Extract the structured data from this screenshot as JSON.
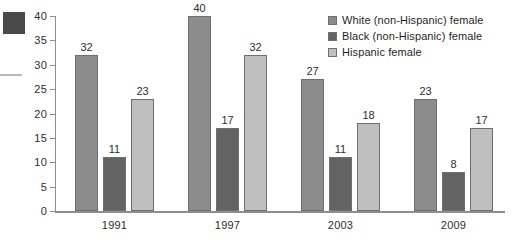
{
  "chart_data": {
    "type": "bar",
    "title": "",
    "xlabel": "",
    "ylabel": "",
    "categories": [
      "1991",
      "1997",
      "2003",
      "2009"
    ],
    "series": [
      {
        "name": "White (non-Hispanic) female",
        "color": "#8c8c8c",
        "values": [
          32,
          40,
          27,
          23
        ]
      },
      {
        "name": "Black (non-Hispanic) female",
        "color": "#636363",
        "values": [
          11,
          17,
          11,
          8
        ]
      },
      {
        "name": "Hispanic female",
        "color": "#bfbfbf",
        "values": [
          23,
          32,
          18,
          17
        ]
      }
    ],
    "ylim": [
      0,
      40
    ],
    "yticks": [
      0,
      5,
      10,
      15,
      20,
      25,
      30,
      35,
      40
    ],
    "grid": false,
    "legend_position": "top-right",
    "data_labels": true
  },
  "legend": {
    "items": [
      {
        "label": "White (non-Hispanic) female"
      },
      {
        "label": "Black (non-Hispanic) female"
      },
      {
        "label": "Hispanic female"
      }
    ]
  }
}
